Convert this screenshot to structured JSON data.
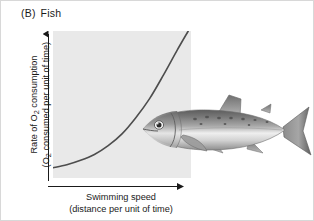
{
  "figure": {
    "panel_letter": "(B)",
    "panel_title": "Fish",
    "background_color": "#ffffff",
    "plot_fill_color": "#e9e9e9",
    "curve_color": "#4d4d4d",
    "axis_color": "#1a1a1a"
  },
  "axes": {
    "y_label_line1": "Rate of O",
    "y_label_line1_sub": "2",
    "y_label_line1_rest": " consumption",
    "y_label_line2_pre": "(O",
    "y_label_line2_sub": "2",
    "y_label_line2_rest": " consumed per unit of time)",
    "x_label_line1": "Swimming speed",
    "x_label_line2": "(distance per unit of time)"
  },
  "organism": {
    "name": "fish-illustration",
    "species_depicted": "salmonid fish",
    "orientation": "facing-left"
  },
  "chart_data": {
    "type": "line",
    "title": "Fish",
    "xlabel": "Swimming speed (distance per unit of time)",
    "ylabel": "Rate of O2 consumption (O2 consumed per unit of time)",
    "grid": false,
    "legend": "none",
    "axis_ticks": "none",
    "xlim": [
      0,
      1
    ],
    "ylim": [
      0,
      1
    ],
    "series": [
      {
        "name": "O2 consumption vs swimming speed",
        "shape": "exponential-increasing",
        "x": [
          0.0,
          0.1,
          0.2,
          0.3,
          0.4,
          0.5,
          0.6,
          0.7,
          0.8,
          0.9,
          0.98
        ],
        "y": [
          0.07,
          0.09,
          0.12,
          0.16,
          0.22,
          0.3,
          0.41,
          0.54,
          0.7,
          0.87,
          1.0
        ]
      }
    ]
  }
}
